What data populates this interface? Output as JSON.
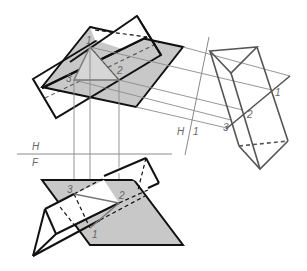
{
  "diagram": {
    "colors": {
      "plane_fill": "#c8c8c8",
      "outline": "#111111",
      "construction": "#8a8a8a",
      "aux_outline": "#555555",
      "label": "#666666"
    },
    "fold_lines": {
      "hf": {
        "upper_label": "H",
        "lower_label": "F"
      },
      "h1": {
        "left_label": "H",
        "right_label": "1"
      }
    },
    "points": {
      "top": [
        {
          "label": "1",
          "x": 90,
          "y": 47
        },
        {
          "label": "2",
          "x": 119,
          "y": 80
        },
        {
          "label": "3",
          "x": 74,
          "y": 80
        }
      ],
      "aux": [
        {
          "label": "1",
          "x": 272,
          "y": 90
        },
        {
          "label": "2",
          "x": 243,
          "y": 110
        },
        {
          "label": "3",
          "x": 231,
          "y": 120
        }
      ],
      "front": [
        {
          "label": "3",
          "x": 74,
          "y": 194
        },
        {
          "label": "2",
          "x": 119,
          "y": 203
        },
        {
          "label": "1",
          "x": 90,
          "y": 228
        }
      ]
    }
  }
}
